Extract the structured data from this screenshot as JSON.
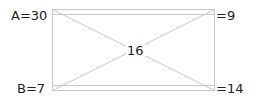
{
  "diagram": {
    "corners": {
      "top_left": {
        "label": "A=30"
      },
      "top_right": {
        "label": "=9"
      },
      "bottom_left": {
        "label": "B=7"
      },
      "bottom_right": {
        "label": "=14"
      }
    },
    "center": {
      "label": "16"
    },
    "line_color": "#c8c8c8"
  }
}
